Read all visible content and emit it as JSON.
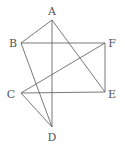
{
  "diagram": {
    "type": "geometry-figure",
    "points": [
      {
        "id": "A",
        "label": "A",
        "x": 52,
        "y": 20,
        "lx": 52,
        "ly": 15
      },
      {
        "id": "B",
        "label": "B",
        "x": 21,
        "y": 43,
        "lx": 13,
        "ly": 47
      },
      {
        "id": "F",
        "label": "F",
        "x": 105,
        "y": 43,
        "lx": 112,
        "ly": 47
      },
      {
        "id": "C",
        "label": "C",
        "x": 21,
        "y": 93,
        "lx": 11,
        "ly": 98
      },
      {
        "id": "E",
        "label": "E",
        "x": 105,
        "y": 92,
        "lx": 112,
        "ly": 98
      },
      {
        "id": "D",
        "label": "D",
        "x": 52,
        "y": 127,
        "lx": 52,
        "ly": 141
      }
    ],
    "edges": [
      [
        "A",
        "B"
      ],
      [
        "A",
        "D"
      ],
      [
        "A",
        "E"
      ],
      [
        "B",
        "F"
      ],
      [
        "B",
        "D"
      ],
      [
        "C",
        "F"
      ],
      [
        "C",
        "E"
      ],
      [
        "C",
        "D"
      ],
      [
        "F",
        "E"
      ]
    ]
  }
}
